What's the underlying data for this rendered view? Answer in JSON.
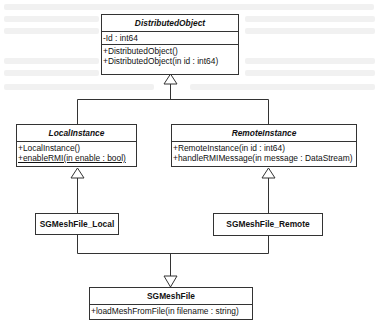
{
  "diagram": {
    "type": "uml-class-diagram",
    "classes": {
      "distributed_object": {
        "name": "DistributedObject",
        "abstract": true,
        "attributes": [
          "-Id : int64"
        ],
        "operations": [
          "+DistributedObject()",
          "+DistributedObject(in id : int64)"
        ]
      },
      "local_instance": {
        "name": "LocalInstance",
        "abstract": true,
        "operations": [
          "+LocalInstance()",
          "+enableRMI(in enable : bool)"
        ],
        "static_operations": [
          "+enableRMI(in enable : bool)"
        ]
      },
      "remote_instance": {
        "name": "RemoteInstance",
        "abstract": true,
        "operations": [
          "+RemoteInstance(in id : int64)",
          "+handleRMIMessage(in message : DataStream)"
        ]
      },
      "sgmeshfile_local": {
        "name": "SGMeshFile_Local"
      },
      "sgmeshfile_remote": {
        "name": "SGMeshFile_Remote"
      },
      "sgmeshfile": {
        "name": "SGMeshFile",
        "operations": [
          "+loadMeshFromFile(in filename : string)"
        ]
      }
    },
    "relationships": [
      {
        "type": "generalization",
        "from": "LocalInstance",
        "to": "DistributedObject"
      },
      {
        "type": "generalization",
        "from": "RemoteInstance",
        "to": "DistributedObject"
      },
      {
        "type": "generalization",
        "from": "SGMeshFile_Local",
        "to": "LocalInstance"
      },
      {
        "type": "generalization",
        "from": "SGMeshFile_Remote",
        "to": "RemoteInstance"
      },
      {
        "type": "generalization",
        "from": "SGMeshFile_Local",
        "to": "SGMeshFile"
      },
      {
        "type": "generalization",
        "from": "SGMeshFile_Remote",
        "to": "SGMeshFile"
      }
    ],
    "colors": {
      "line": "#333333",
      "background": "#ffffff"
    }
  }
}
